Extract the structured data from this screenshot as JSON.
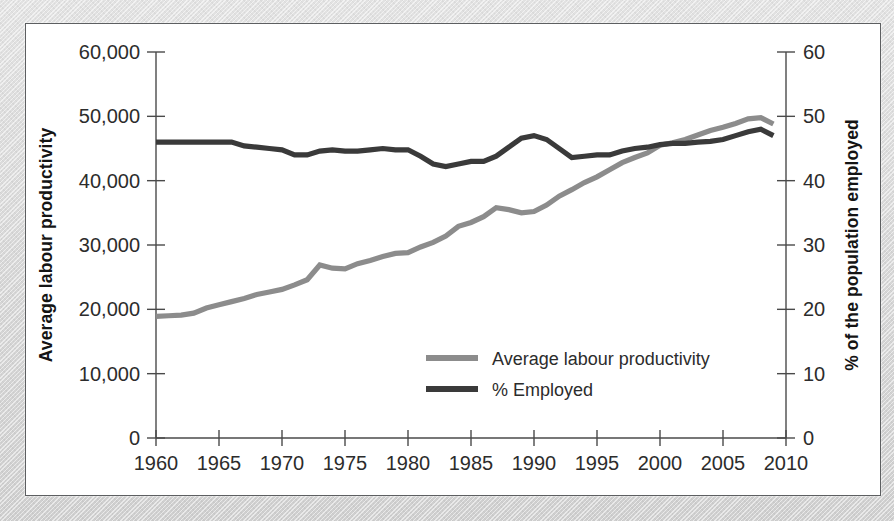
{
  "figure": {
    "frame_color": "#5d5f61",
    "mount_color": "#d9d9d9",
    "plot_background": "#ffffff"
  },
  "chart_data": {
    "type": "line",
    "title": "",
    "xlabel": "",
    "ylabel": "Average labour productivity",
    "y2label": "% of the population employed",
    "xlim": [
      1960,
      2010
    ],
    "ylim": [
      0,
      60000
    ],
    "y2lim": [
      0,
      60
    ],
    "grid": false,
    "legend_position": "inside-lower-right",
    "x_ticks": [
      "1960",
      "1965",
      "1970",
      "1975",
      "1980",
      "1985",
      "1990",
      "1995",
      "2000",
      "2005",
      "2010"
    ],
    "x_tick_values": [
      1960,
      1965,
      1970,
      1975,
      1980,
      1985,
      1990,
      1995,
      2000,
      2005,
      2010
    ],
    "y_ticks": [
      "0",
      "10,000",
      "20,000",
      "30,000",
      "40,000",
      "50,000",
      "60,000"
    ],
    "y_tick_values": [
      0,
      10000,
      20000,
      30000,
      40000,
      50000,
      60000
    ],
    "y2_ticks": [
      "0",
      "10",
      "20",
      "30",
      "40",
      "50",
      "60"
    ],
    "y2_tick_values": [
      0,
      10,
      20,
      30,
      40,
      50,
      60
    ],
    "x": [
      1960,
      1961,
      1962,
      1963,
      1964,
      1965,
      1966,
      1967,
      1968,
      1969,
      1970,
      1971,
      1972,
      1973,
      1974,
      1975,
      1976,
      1977,
      1978,
      1979,
      1980,
      1981,
      1982,
      1983,
      1984,
      1985,
      1986,
      1987,
      1988,
      1989,
      1990,
      1991,
      1992,
      1993,
      1994,
      1995,
      1996,
      1997,
      1998,
      1999,
      2000,
      2001,
      2002,
      2003,
      2004,
      2005,
      2006,
      2007,
      2008,
      2009
    ],
    "series": [
      {
        "name": "Average labour productivity",
        "color": "#8c8c8c",
        "axis": "left",
        "stroke_width": 5.2,
        "values": [
          18900,
          19000,
          19100,
          19400,
          20200,
          20700,
          21200,
          21700,
          22300,
          22700,
          23100,
          23800,
          24600,
          26900,
          26400,
          26300,
          27100,
          27600,
          28200,
          28700,
          28800,
          29700,
          30400,
          31400,
          32900,
          33500,
          34400,
          35800,
          35500,
          35000,
          35200,
          36200,
          37600,
          38600,
          39700,
          40600,
          41700,
          42800,
          43600,
          44300,
          45500,
          45900,
          46400,
          47100,
          47800,
          48300,
          48900,
          49600,
          49800,
          48800
        ]
      },
      {
        "name": "% Employed",
        "color": "#3a3a3a",
        "axis": "right",
        "stroke_width": 5.2,
        "values": [
          46.0,
          46.0,
          46.0,
          46.0,
          46.0,
          46.0,
          46.0,
          45.4,
          45.2,
          45.0,
          44.8,
          44.0,
          44.0,
          44.6,
          44.8,
          44.6,
          44.6,
          44.8,
          45.0,
          44.8,
          44.8,
          43.8,
          42.6,
          42.2,
          42.6,
          43.0,
          43.0,
          43.8,
          45.2,
          46.6,
          47.0,
          46.4,
          45.0,
          43.6,
          43.8,
          44.0,
          44.0,
          44.6,
          45.0,
          45.2,
          45.6,
          45.8,
          45.8,
          46.0,
          46.1,
          46.4,
          47.0,
          47.6,
          48.0,
          47.0
        ]
      }
    ]
  },
  "legend": {
    "entries": [
      {
        "label": "Average labour productivity",
        "color": "#8c8c8c"
      },
      {
        "label": "% Employed",
        "color": "#3a3a3a"
      }
    ]
  }
}
